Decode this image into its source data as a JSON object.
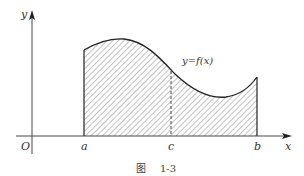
{
  "diagram": {
    "axes": {
      "x_label": "x",
      "y_label": "y",
      "origin_label": "O"
    },
    "points": {
      "a": "a",
      "c": "c",
      "b": "b"
    },
    "curve_label": "y=f(x)",
    "caption": {
      "prefix": "图",
      "number": "1-3"
    },
    "colors": {
      "stroke": "#333333",
      "hatch": "#555555",
      "background": "#ffffff"
    }
  }
}
